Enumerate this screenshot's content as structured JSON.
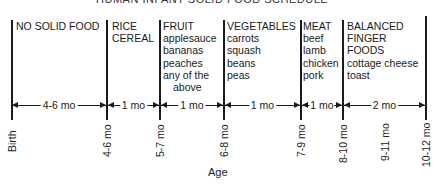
{
  "title": "HUMAN INFANT SOLID FOOD SCHEDULE",
  "stages": [
    {
      "heading": "NO SOLID FOOD",
      "items": []
    },
    {
      "heading": "RICE",
      "heading2": "CEREAL",
      "items": []
    },
    {
      "heading": "FRUIT",
      "items": [
        "applesauce",
        "bananas",
        "peaches",
        "any of the",
        "above"
      ]
    },
    {
      "heading": "VEGETABLES",
      "items": [
        "carrots",
        "squash",
        "beans",
        "peas"
      ]
    },
    {
      "heading": "MEAT",
      "items": [
        "beef",
        "lamb",
        "chicken",
        "pork"
      ]
    },
    {
      "heading": "BALANCED",
      "heading2": "FINGER",
      "heading3": "FOODS",
      "items": [
        "cottage cheese",
        "toast"
      ]
    }
  ],
  "durations": [
    "4-6 mo",
    "1 mo",
    "1 mo",
    "1 mo",
    "1 mo",
    "2 mo"
  ],
  "ticks": [
    "Birth",
    "4-6 mo",
    "5-7 mo",
    "6-8 mo",
    "7-9 mo",
    "8-10 mo",
    "9-11 mo",
    "10-12 mo"
  ],
  "axis_label": "Age"
}
